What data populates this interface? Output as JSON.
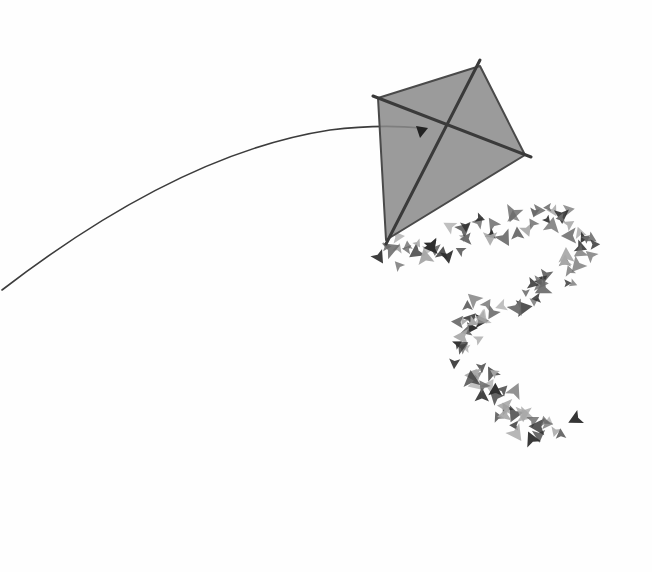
{
  "scene": {
    "width": 652,
    "height": 572,
    "background": "#fefefe",
    "description": "Ink wash painting of a diamond kite with a long string and a leafy tail"
  },
  "kite": {
    "fill": "#8a8a8a",
    "fill_opacity": 0.85,
    "edge": "#4a4a4a",
    "spar": "#3a3a3a",
    "points": {
      "top": [
        480,
        66
      ],
      "right": [
        525,
        155
      ],
      "bottom": [
        386,
        240
      ],
      "left": [
        378,
        98
      ]
    },
    "center": [
      422,
      130
    ]
  },
  "string": {
    "color": "#3c3c3c",
    "width": 1.6,
    "path": "M2,290 C80,230 200,150 330,130 C370,125 400,126 422,128"
  },
  "tail": {
    "color_dark": "#2e2e2e",
    "color_mid": "#6a6a6a",
    "color_light": "#a8a8a8",
    "path": [
      [
        386,
        245
      ],
      [
        410,
        255
      ],
      [
        440,
        250
      ],
      [
        470,
        235
      ],
      [
        505,
        225
      ],
      [
        540,
        218
      ],
      [
        570,
        222
      ],
      [
        585,
        245
      ],
      [
        575,
        270
      ],
      [
        545,
        288
      ],
      [
        510,
        300
      ],
      [
        480,
        315
      ],
      [
        460,
        335
      ],
      [
        465,
        360
      ],
      [
        485,
        380
      ],
      [
        500,
        400
      ],
      [
        515,
        420
      ],
      [
        540,
        432
      ],
      [
        570,
        428
      ]
    ]
  }
}
